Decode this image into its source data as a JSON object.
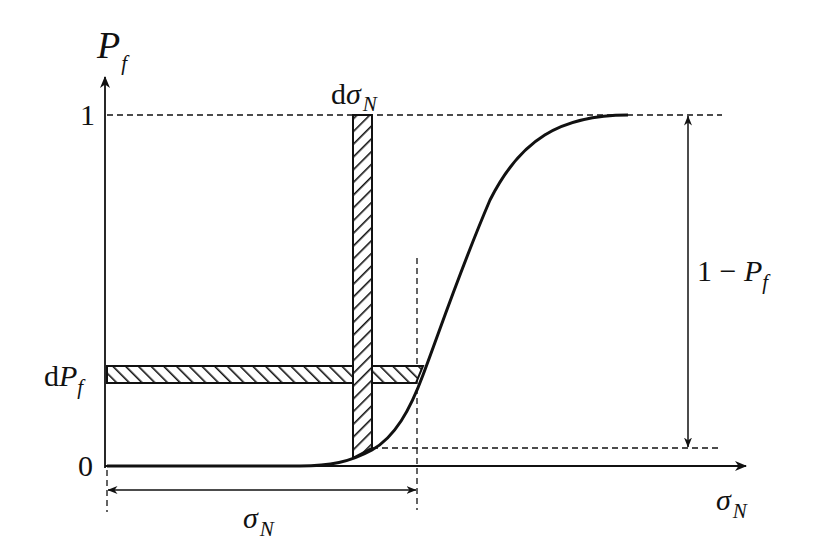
{
  "diagram": {
    "type": "cumulative-probability-curve",
    "colors": {
      "ink": "#111111",
      "background": "#ffffff"
    },
    "axes": {
      "y_label_main": "P",
      "y_label_sub": "f",
      "x_label_main": "σ",
      "x_label_sub": "N"
    },
    "ticks": {
      "y_one": "1",
      "y_zero": "0"
    },
    "annotations": {
      "d_sigma_prefix": "d",
      "d_sigma_main": "σ",
      "d_sigma_sub": "N",
      "d_pf_prefix": "d",
      "d_pf_main": "P",
      "d_pf_sub": "f",
      "one_minus_pf_prefix": "1 − ",
      "one_minus_pf_main": "P",
      "one_minus_pf_sub": "f",
      "sigma_span_main": "σ",
      "sigma_span_sub": "N"
    },
    "elements": [
      "S-shaped cumulative failure probability curve from 0 to 1",
      "Hatched vertical strip of width dσN spanning from curve to 1",
      "Hatched horizontal strip of height dPf spanning from axis to curve",
      "Double arrow showing σN from origin to stress level",
      "Double arrow showing 1 − Pf on right side"
    ]
  }
}
